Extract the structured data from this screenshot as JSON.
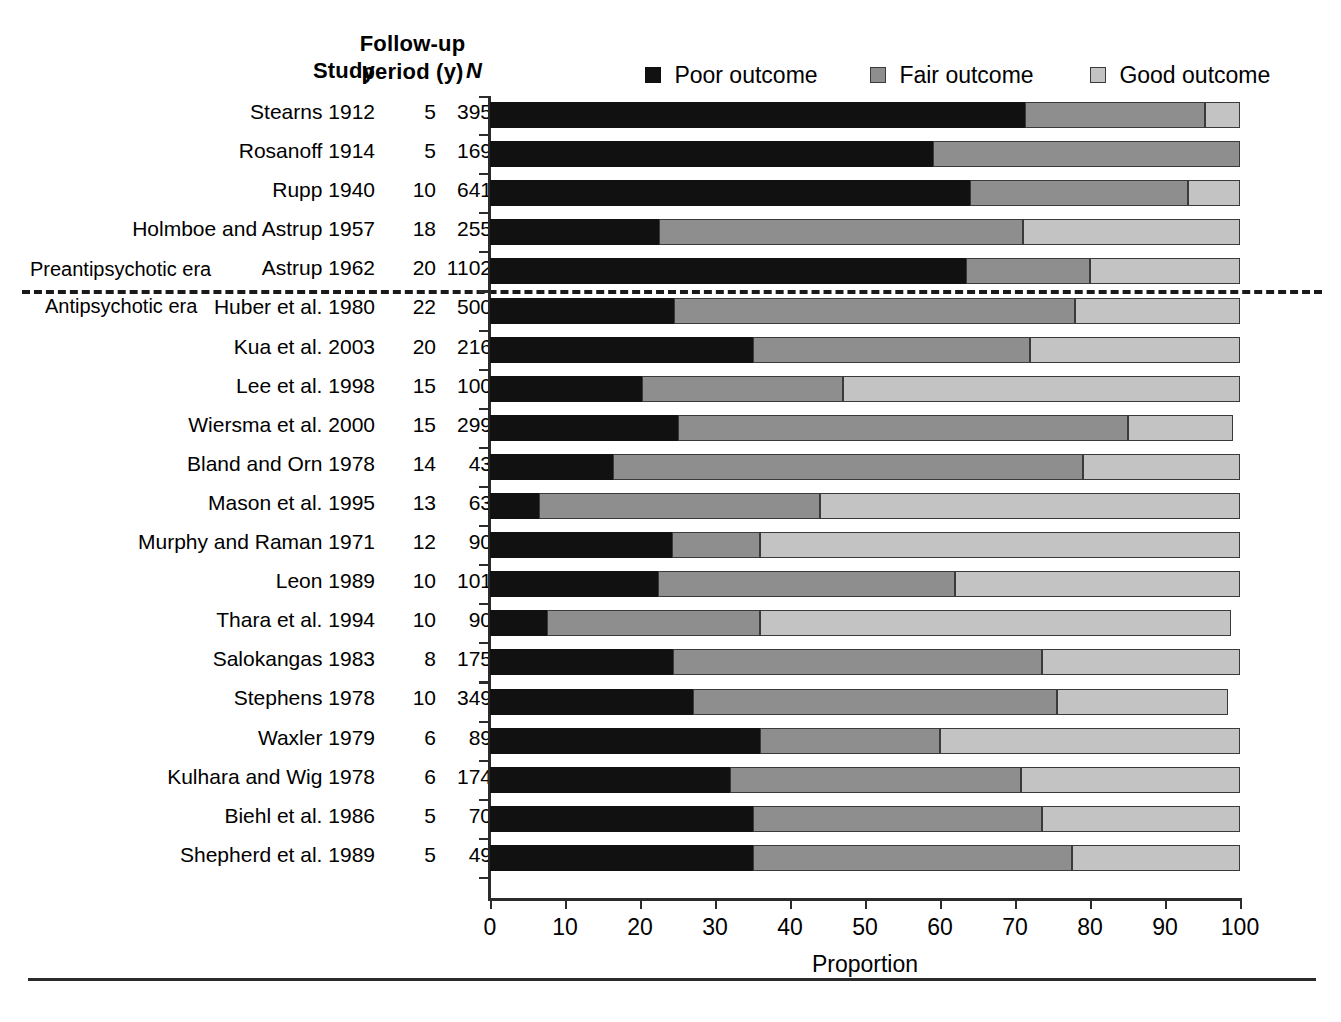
{
  "headers": {
    "study": "Study",
    "follow_up_line1": "Follow-up",
    "follow_up_line2": "period (y)",
    "n": "N"
  },
  "eras": {
    "pre": "Preantipsychotic era",
    "post": "Antipsychotic era"
  },
  "legend": {
    "poor": "Poor outcome",
    "fair": "Fair outcome",
    "good": "Good outcome"
  },
  "axis": {
    "title": "Proportion",
    "ticks": [
      "0",
      "10",
      "20",
      "30",
      "40",
      "50",
      "60",
      "70",
      "80",
      "90",
      "100"
    ]
  },
  "chart_data": {
    "type": "bar",
    "subtype": "stacked-horizontal-100",
    "title": "",
    "xlabel": "Proportion",
    "ylabel": "",
    "xlim": [
      0,
      100
    ],
    "grid": false,
    "legend_position": "top",
    "series": [
      {
        "name": "Poor outcome",
        "color": "#111111"
      },
      {
        "name": "Fair outcome",
        "color": "#8e8e8e"
      },
      {
        "name": "Good outcome",
        "color": "#c3c3c3"
      }
    ],
    "columns": [
      "Study",
      "Follow-up period (y)",
      "N",
      "Poor outcome",
      "Fair outcome",
      "Good outcome"
    ],
    "rows": [
      {
        "study": "Stearns 1912",
        "follow_up": "5",
        "n": "395",
        "era": "pre",
        "poor": 71.3,
        "fair": 24.0,
        "good": 4.7
      },
      {
        "study": "Rosanoff 1914",
        "follow_up": "5",
        "n": "169",
        "era": "pre",
        "poor": 59.0,
        "fair": 41.0,
        "good": 0.0
      },
      {
        "study": "Rupp 1940",
        "follow_up": "10",
        "n": "641",
        "era": "pre",
        "poor": 64.0,
        "fair": 29.0,
        "good": 7.0
      },
      {
        "study": "Holmboe and Astrup 1957",
        "follow_up": "18",
        "n": "255",
        "era": "pre",
        "poor": 22.5,
        "fair": 48.5,
        "good": 29.0
      },
      {
        "study": "Astrup 1962",
        "follow_up": "20",
        "n": "1102",
        "era": "pre",
        "poor": 63.5,
        "fair": 16.5,
        "good": 20.0
      },
      {
        "study": "Huber et al. 1980",
        "follow_up": "22",
        "n": "500",
        "era": "post",
        "poor": 24.5,
        "fair": 53.5,
        "good": 22.0
      },
      {
        "study": "Kua et al. 2003",
        "follow_up": "20",
        "n": "216",
        "era": "post",
        "poor": 35.0,
        "fair": 37.0,
        "good": 28.0
      },
      {
        "study": "Lee et al. 1998",
        "follow_up": "15",
        "n": "100",
        "era": "post",
        "poor": 20.3,
        "fair": 26.7,
        "good": 53.0
      },
      {
        "study": "Wiersma et al. 2000",
        "follow_up": "15",
        "n": "299",
        "era": "post",
        "poor": 25.0,
        "fair": 60.0,
        "good": 14.0
      },
      {
        "study": "Bland and Orn 1978",
        "follow_up": "14",
        "n": "43",
        "era": "post",
        "poor": 16.4,
        "fair": 62.6,
        "good": 21.0
      },
      {
        "study": "Mason et al. 1995",
        "follow_up": "13",
        "n": "63",
        "era": "post",
        "poor": 6.5,
        "fair": 37.5,
        "good": 56.0
      },
      {
        "study": "Murphy and Raman 1971",
        "follow_up": "12",
        "n": "90",
        "era": "post",
        "poor": 24.3,
        "fair": 11.7,
        "good": 64.0
      },
      {
        "study": "Leon 1989",
        "follow_up": "10",
        "n": "101",
        "era": "post",
        "poor": 22.4,
        "fair": 39.6,
        "good": 38.0
      },
      {
        "study": "Thara et al. 1994",
        "follow_up": "10",
        "n": "90",
        "era": "post",
        "poor": 7.6,
        "fair": 28.4,
        "good": 62.8
      },
      {
        "study": "Salokangas 1983",
        "follow_up": "8",
        "n": "175",
        "era": "post",
        "poor": 24.4,
        "fair": 49.2,
        "good": 26.4
      },
      {
        "study": "Stephens 1978",
        "follow_up": "10",
        "n": "349",
        "era": "post",
        "poor": 27.0,
        "fair": 48.6,
        "good": 22.8
      },
      {
        "study": "Waxler 1979",
        "follow_up": "6",
        "n": "89",
        "era": "post",
        "poor": 36.0,
        "fair": 24.0,
        "good": 40.0
      },
      {
        "study": "Kulhara and Wig 1978",
        "follow_up": "6",
        "n": "174",
        "era": "post",
        "poor": 32.0,
        "fair": 38.8,
        "good": 29.2
      },
      {
        "study": "Biehl et al. 1986",
        "follow_up": "5",
        "n": "70",
        "era": "post",
        "poor": 35.0,
        "fair": 38.6,
        "good": 26.4
      },
      {
        "study": "Shepherd et al. 1989",
        "follow_up": "5",
        "n": "49",
        "era": "post",
        "poor": 35.0,
        "fair": 42.6,
        "good": 22.4
      }
    ]
  }
}
